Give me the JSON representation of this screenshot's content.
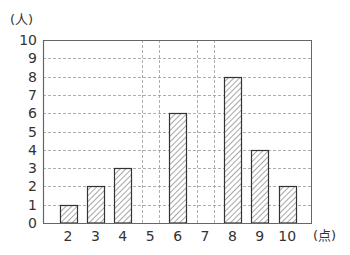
{
  "chart_data": {
    "type": "bar",
    "title": "",
    "xlabel": "(点)",
    "ylabel": "(人)",
    "categories": [
      "2",
      "3",
      "4",
      "5",
      "6",
      "7",
      "8",
      "9",
      "10"
    ],
    "values": [
      1,
      2,
      3,
      0,
      6,
      0,
      8,
      4,
      2
    ],
    "ylim": [
      0,
      10
    ],
    "yticks": [
      0,
      1,
      2,
      3,
      4,
      5,
      6,
      7,
      8,
      9,
      10
    ],
    "grid": true,
    "grid_style": "dashed",
    "bar_fill": "hatched",
    "legend": null
  },
  "colors": {
    "axis": "#666666",
    "grid": "#999999",
    "bar_outline": "#333333",
    "hatch": "#777777",
    "text": "#333333"
  }
}
